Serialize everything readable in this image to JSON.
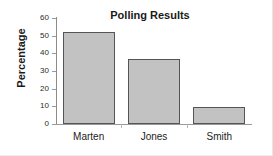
{
  "chart_data": {
    "type": "bar",
    "title": "Polling Results",
    "xlabel": "",
    "ylabel": "Percentage",
    "categories": [
      "Marten",
      "Jones",
      "Smith"
    ],
    "values": [
      52,
      37,
      9.5
    ],
    "ylim": [
      0,
      60
    ],
    "yticks": [
      0,
      10,
      20,
      30,
      40,
      50,
      60
    ],
    "ytick_labels": [
      "0",
      "10",
      "20",
      "30",
      "40",
      "50",
      "60"
    ],
    "grid": false,
    "legend": "none",
    "bar_fill_color": "#c2c2c2",
    "bar_border_color": "#555555",
    "axis_color": "#9a9a9a",
    "text_color": "#1a1a1a"
  }
}
